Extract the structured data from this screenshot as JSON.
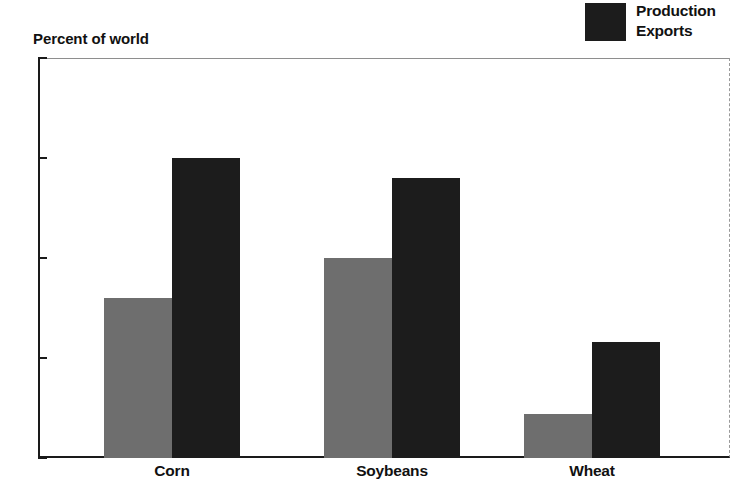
{
  "chart_data": {
    "type": "bar",
    "title": "",
    "ylabel": "Percent of world",
    "xlabel": "",
    "categories": [
      "Corn",
      "Soybeans",
      "Wheat"
    ],
    "series": [
      {
        "name": "Production",
        "color": "#6e6e6e",
        "values": [
          40,
          50,
          11
        ]
      },
      {
        "name": "Exports",
        "color": "#1c1c1c",
        "values": [
          75,
          70,
          29
        ]
      }
    ],
    "ylim": [
      0,
      100
    ],
    "yticks": [
      0,
      25,
      50,
      75,
      100
    ],
    "ytick_labels": [
      "0",
      "25",
      "50",
      "75",
      "100"
    ],
    "grid": false,
    "legend_position": "top-right"
  },
  "legend": {
    "entries": [
      {
        "label": "Production",
        "color": "#1c1c1c"
      },
      {
        "label": "Exports",
        "color": "#1c1c1c"
      }
    ]
  },
  "axis": {
    "y_title": "Percent of world"
  },
  "colors": {
    "production": "#6e6e6e",
    "exports": "#1c1c1c",
    "axis": "#1a1a1a",
    "frame": "#9a9a9a",
    "background": "#ffffff"
  }
}
